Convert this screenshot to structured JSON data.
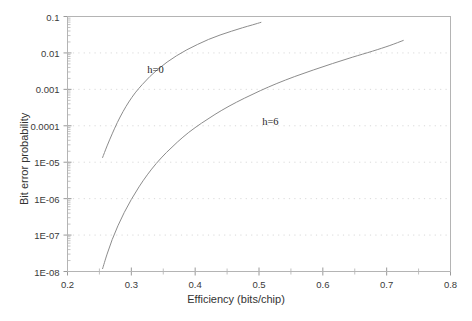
{
  "chart_data": {
    "type": "line",
    "title": "",
    "xlabel": "Efficiency (bits/chip)",
    "ylabel": "Bit error probability",
    "xlim": [
      0.2,
      0.8
    ],
    "ylim": [
      1e-08,
      0.1
    ],
    "yscale": "log",
    "xscale": "linear",
    "grid": true,
    "grid_style": "dotted-horizontal-major",
    "legend_position": "inline-annotations",
    "xticks": [
      0.2,
      0.3,
      0.4,
      0.5,
      0.6,
      0.7,
      0.8
    ],
    "xtick_labels": [
      "0.2",
      "0.3",
      "0.4",
      "0.5",
      "0.6",
      "0.7",
      "0.8"
    ],
    "xminor_ticks": [
      0.25,
      0.35,
      0.45,
      0.55,
      0.65,
      0.75
    ],
    "yticks": [
      0.1,
      0.01,
      0.001,
      0.0001,
      1e-05,
      1e-06,
      1e-07,
      1e-08
    ],
    "ytick_labels": [
      "0.1",
      "0.01",
      "0.001",
      "0.0001",
      "1E-05",
      "1E-06",
      "1E-07",
      "1E-08"
    ],
    "line_color": "#8c8c8c",
    "axis_color": "#b4b4b4",
    "grid_color": "#d9d9d9",
    "background": "#ffffff",
    "series": [
      {
        "name": "h=0",
        "label": "h=0",
        "label_x": 0.325,
        "label_y": 0.0033,
        "points": [
          [
            0.255,
            1.35e-05
          ],
          [
            0.262,
            2.8e-05
          ],
          [
            0.27,
            6e-05
          ],
          [
            0.278,
            0.000122
          ],
          [
            0.287,
            0.000245
          ],
          [
            0.296,
            0.00045
          ],
          [
            0.306,
            0.0008
          ],
          [
            0.317,
            0.00135
          ],
          [
            0.329,
            0.00225
          ],
          [
            0.342,
            0.0036
          ],
          [
            0.356,
            0.0056
          ],
          [
            0.371,
            0.0084
          ],
          [
            0.387,
            0.0122
          ],
          [
            0.404,
            0.0172
          ],
          [
            0.421,
            0.0235
          ],
          [
            0.439,
            0.031
          ],
          [
            0.457,
            0.0395
          ],
          [
            0.474,
            0.049
          ],
          [
            0.49,
            0.059
          ],
          [
            0.503,
            0.069
          ]
        ]
      },
      {
        "name": "h=6",
        "label": "h=6",
        "label_x": 0.505,
        "label_y": 0.000125,
        "points": [
          [
            0.255,
            1.2e-08
          ],
          [
            0.262,
            3e-08
          ],
          [
            0.27,
            7.5e-08
          ],
          [
            0.279,
            1.8e-07
          ],
          [
            0.289,
            4.2e-07
          ],
          [
            0.3,
            9.5e-07
          ],
          [
            0.312,
            2.1e-06
          ],
          [
            0.325,
            4.5e-06
          ],
          [
            0.339,
            9.2e-06
          ],
          [
            0.355,
            1.85e-05
          ],
          [
            0.372,
            3.55e-05
          ],
          [
            0.39,
            6.6e-05
          ],
          [
            0.41,
            0.000118
          ],
          [
            0.431,
            0.000205
          ],
          [
            0.453,
            0.000345
          ],
          [
            0.477,
            0.00057
          ],
          [
            0.502,
            0.00092
          ],
          [
            0.528,
            0.00145
          ],
          [
            0.556,
            0.00225
          ],
          [
            0.585,
            0.0034
          ],
          [
            0.615,
            0.0051
          ],
          [
            0.646,
            0.0076
          ],
          [
            0.678,
            0.0112
          ],
          [
            0.705,
            0.016
          ],
          [
            0.726,
            0.022
          ]
        ]
      }
    ]
  }
}
